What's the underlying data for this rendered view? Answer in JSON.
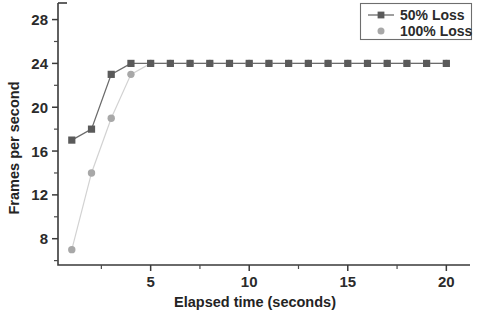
{
  "chart_data": {
    "type": "line",
    "title": "",
    "subtitle": "",
    "xlabel": "Elapsed time (seconds)",
    "ylabel": "Frames per second",
    "xlim": [
      0.3,
      21.2
    ],
    "ylim": [
      5.6,
      28.6
    ],
    "xticks": [
      5,
      10,
      15,
      20
    ],
    "xtick_labels": [
      "5",
      "10",
      "15",
      "20"
    ],
    "xticks_minor": [
      2.5,
      7.5,
      12.5,
      17.5
    ],
    "yticks": [
      8,
      12,
      16,
      20,
      24,
      28
    ],
    "ytick_labels": [
      "8",
      "12",
      "16",
      "20",
      "24",
      "28"
    ],
    "yticks_minor": [
      10,
      14,
      18,
      22,
      26
    ],
    "grid": false,
    "legend_position": "top-right",
    "x": [
      1,
      2,
      3,
      4,
      5,
      6,
      7,
      8,
      9,
      10,
      11,
      12,
      13,
      14,
      15,
      16,
      17,
      18,
      19,
      20
    ],
    "series": [
      {
        "name": "50% Loss",
        "marker": "square",
        "color": "#5a5a5a",
        "line_color": "#6b6b6b",
        "values": [
          17,
          18,
          23,
          24,
          24,
          24,
          24,
          24,
          24,
          24,
          24,
          24,
          24,
          24,
          24,
          24,
          24,
          24,
          24,
          24
        ]
      },
      {
        "name": "100% Loss",
        "marker": "circle",
        "color": "#a8a8a8",
        "line_color": "#d2d2d2",
        "values": [
          7,
          14,
          19,
          23,
          24,
          24,
          24,
          24,
          24,
          24,
          24,
          24,
          24,
          24,
          24,
          24,
          24,
          24,
          24,
          24
        ]
      }
    ]
  },
  "legend": {
    "entries": [
      {
        "label": "50% Loss"
      },
      {
        "label": "100% Loss"
      }
    ]
  },
  "axes": {
    "x_title": "Elapsed time (seconds)",
    "y_title": "Frames per second"
  }
}
